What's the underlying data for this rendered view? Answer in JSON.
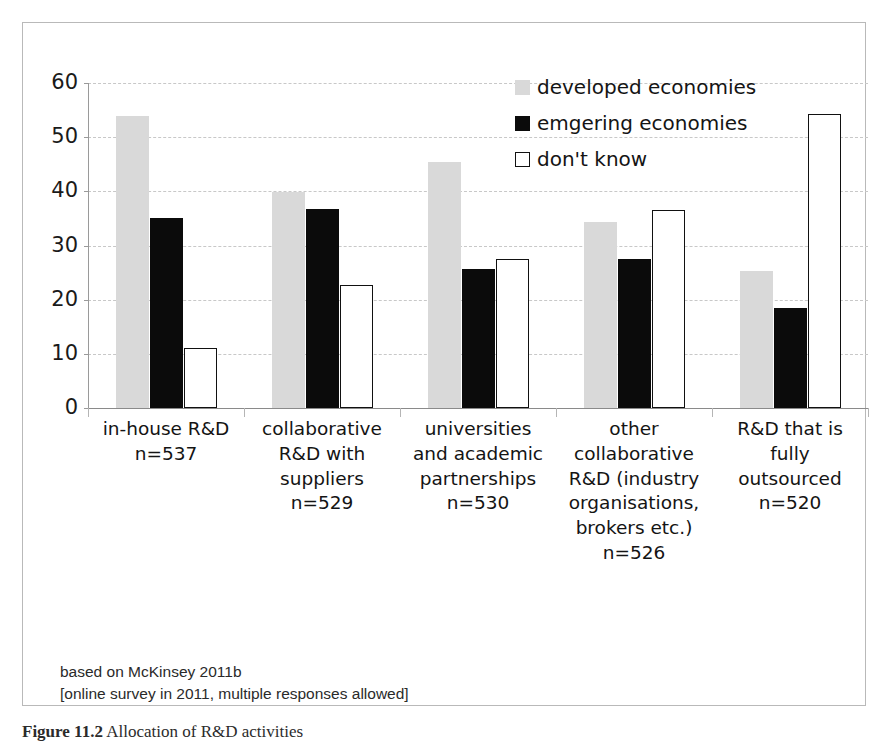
{
  "chart_data": {
    "type": "bar",
    "title": "",
    "xlabel": "",
    "ylabel": "",
    "ylim": [
      0,
      60
    ],
    "yticks": [
      0,
      10,
      20,
      30,
      40,
      50,
      60
    ],
    "grid": true,
    "legend_position": "top-right",
    "categories": [
      "in-house R&D\nn=537",
      "collaborative\nR&D with\nsuppliers\nn=529",
      "universities\nand academic\npartnerships\nn=530",
      "other\ncollaborative\nR&D (industry\norganisations,\nbrokers etc.)\nn=526",
      "R&D that is\nfully\noutsourced\nn=520"
    ],
    "category_lines": [
      [
        "in-house R&D",
        "n=537"
      ],
      [
        "collaborative",
        "R&D with",
        "suppliers",
        "n=529"
      ],
      [
        "universities",
        "and academic",
        "partnerships",
        "n=530"
      ],
      [
        "other",
        "collaborative",
        "R&D (industry",
        "organisations,",
        "brokers etc.)",
        "n=526"
      ],
      [
        "R&D that is",
        "fully",
        "outsourced",
        "n=520"
      ]
    ],
    "series": [
      {
        "name": "developed economies",
        "color": "#d9d9d9",
        "values": [
          54.0,
          39.8,
          45.5,
          34.4,
          25.3
        ]
      },
      {
        "name": "emgering economies",
        "color": "#0b0b0b",
        "values": [
          35.0,
          36.8,
          25.6,
          27.5,
          18.4
        ]
      },
      {
        "name": "don't know",
        "color": "#ffffff",
        "values": [
          11.0,
          22.8,
          27.6,
          36.5,
          54.3
        ]
      }
    ]
  },
  "legend": {
    "items": [
      {
        "label": "developed economies",
        "swatch": "developed"
      },
      {
        "label": "emgering economies",
        "swatch": "emerging"
      },
      {
        "label": "don't know",
        "swatch": "dontknow"
      }
    ]
  },
  "footnotes": {
    "line1": "based on McKinsey 2011b",
    "line2": "[online survey in 2011, multiple responses allowed]"
  },
  "caption": {
    "label": "Figure 11.2",
    "text": "Allocation of R&D activities"
  }
}
